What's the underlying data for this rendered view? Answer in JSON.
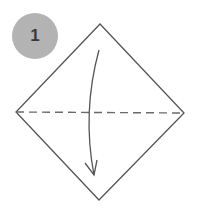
{
  "step": {
    "number": "1",
    "badge_color": "#b3b3b3",
    "number_color": "#3a3a3a"
  },
  "diagram": {
    "type": "origami-fold-instruction",
    "square": {
      "orientation": "diamond",
      "stroke_color": "#555555",
      "vertices": {
        "top": [
          100,
          24
        ],
        "right": [
          184,
          113
        ],
        "bottom": [
          99,
          200
        ],
        "left": [
          16,
          112
        ]
      }
    },
    "fold_line": {
      "style": "valley-fold-dashed",
      "stroke_color": "#6a6a6a",
      "from": [
        16,
        112
      ],
      "to": [
        184,
        113
      ]
    },
    "arrow": {
      "icon": "curved-fold-arrow",
      "direction": "down",
      "stroke_color": "#555555",
      "start": [
        99,
        50
      ],
      "end": [
        94,
        175
      ]
    }
  }
}
